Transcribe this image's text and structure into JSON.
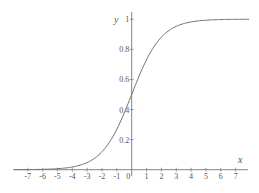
{
  "chart_data": {
    "type": "line",
    "title": "",
    "function": "y = 1 / (1 + e^(-x))",
    "xlabel": "x",
    "ylabel": "y",
    "xlim": [
      -7.9,
      7.9
    ],
    "ylim": [
      0,
      1.05
    ],
    "grid": false,
    "legend": null,
    "x_ticks": [
      -7,
      -6,
      -5,
      -4,
      -3,
      -2,
      -1,
      0,
      1,
      2,
      3,
      4,
      5,
      6,
      7
    ],
    "x_tick_labels": [
      "-7",
      "-6",
      "-5",
      "-4",
      "-3",
      "-2",
      "-1",
      "0",
      "1",
      "2",
      "3",
      "4",
      "5",
      "6",
      "7"
    ],
    "y_ticks": [
      0.2,
      0.4,
      0.6,
      0.8,
      1
    ],
    "y_tick_labels": [
      "0.2",
      "0.4",
      "0.6",
      "0.8",
      "1"
    ],
    "series": [
      {
        "name": "sigmoid",
        "color": "#707070",
        "x": [
          -7,
          -6,
          -5,
          -4,
          -3,
          -2,
          -1,
          0,
          1,
          2,
          3,
          4,
          5,
          6,
          7
        ],
        "values": [
          0.001,
          0.002,
          0.007,
          0.018,
          0.047,
          0.119,
          0.269,
          0.5,
          0.731,
          0.881,
          0.953,
          0.982,
          0.993,
          0.998,
          0.999
        ]
      }
    ]
  },
  "colors": {
    "axis": "#777777",
    "curve": "#707070",
    "text": "#555555"
  }
}
